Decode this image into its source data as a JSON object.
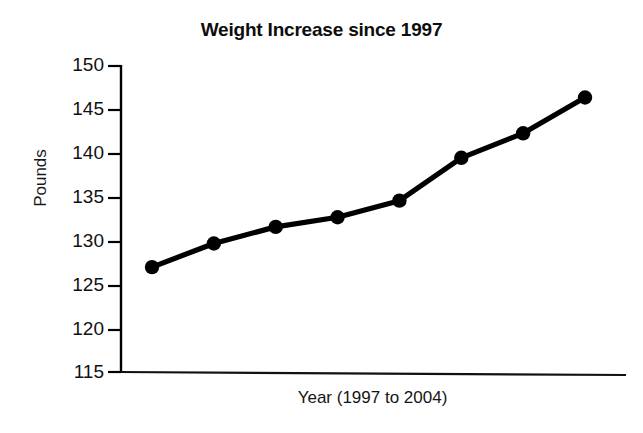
{
  "chart_data": {
    "type": "line",
    "title": "Weight Increase since 1997",
    "xlabel": "Year (1997 to 2004)",
    "ylabel": "Pounds",
    "categories": [
      "1997",
      "1998",
      "1999",
      "2000",
      "2001",
      "2002",
      "2003",
      "2004"
    ],
    "x": [
      1997,
      1998,
      1999,
      2000,
      2001,
      2002,
      2003,
      2004
    ],
    "values": [
      127.0,
      129.7,
      131.6,
      132.7,
      134.6,
      139.5,
      142.3,
      146.4
    ],
    "series": [
      {
        "name": "Pounds",
        "values": [
          127.0,
          129.7,
          131.6,
          132.7,
          134.6,
          139.5,
          142.3,
          146.4
        ],
        "color": "#000000",
        "marker": "filled-circle"
      }
    ],
    "ylim": [
      115,
      150
    ],
    "yticks": [
      150,
      145,
      140,
      135,
      130,
      125,
      120,
      115
    ],
    "ytick_labels": [
      "150",
      "145",
      "140",
      "135",
      "130",
      "125",
      "120",
      "115"
    ],
    "xticks": [],
    "xtick_labels": [],
    "grid": false,
    "legend": false,
    "legend_position": "none",
    "line_color": "#000000",
    "marker_color": "#000000",
    "background_color": "#ffffff",
    "axis_color": "#000000"
  },
  "axes": {
    "y_axis_name": "y-axis-line",
    "x_axis_name": "x-axis-line"
  }
}
